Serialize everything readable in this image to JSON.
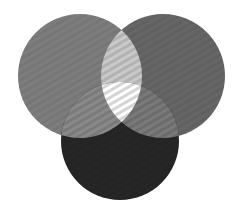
{
  "diagram": {
    "type": "venn",
    "sets": 3,
    "background": "#ffffff",
    "circles": [
      {
        "id": "left",
        "cx": 80,
        "cy": 76,
        "r": 62,
        "color": "#7d7d7d"
      },
      {
        "id": "right",
        "cx": 163,
        "cy": 76,
        "r": 62,
        "color": "#666666"
      },
      {
        "id": "bottom",
        "cx": 120,
        "cy": 141,
        "r": 59,
        "color": "#262626"
      }
    ],
    "overlaps": {
      "left_right": "#c9c9c9",
      "left_bottom": "#8a8a8a",
      "right_bottom": "#7a7a7a",
      "all_three": "#ffffff"
    }
  }
}
